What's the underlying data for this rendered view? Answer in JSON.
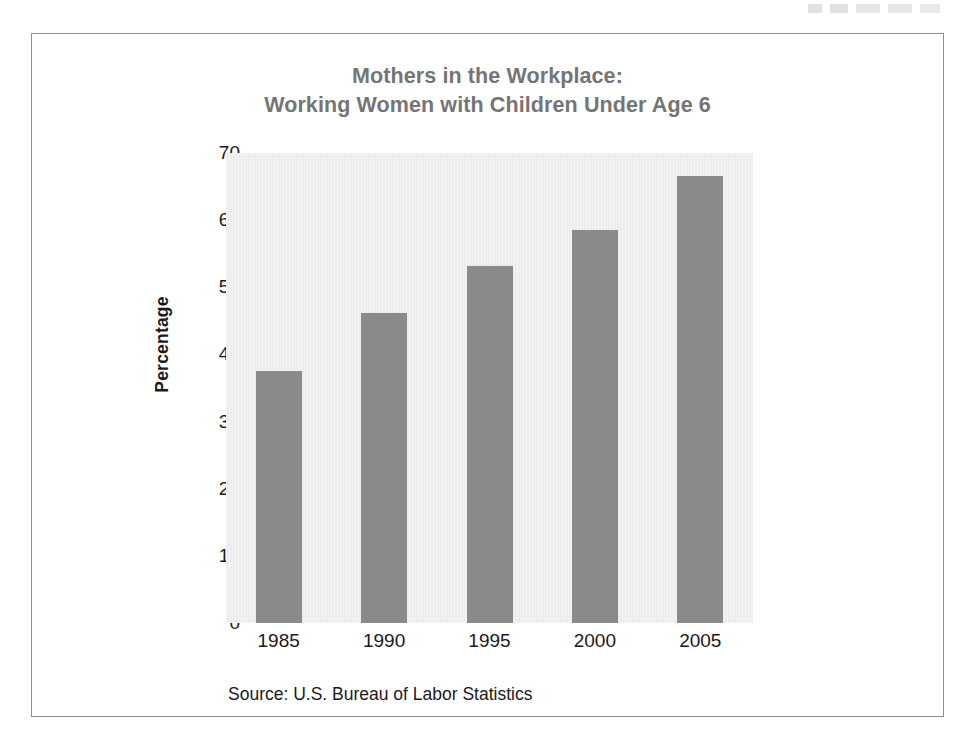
{
  "figure": {
    "title_line_1": "Mothers in the Workplace:",
    "title_line_2": "Working Women with Children Under Age 6",
    "source_note": "Source: U.S. Bureau of Labor Statistics",
    "title_color": "#757575",
    "frame_color": "#8e8e8e"
  },
  "chart_data": {
    "type": "bar",
    "title": "Mothers in the Workplace: Working Women with Children Under Age 6",
    "categories": [
      "1985",
      "1990",
      "1995",
      "2000",
      "2005"
    ],
    "values": [
      37.5,
      46.2,
      53.2,
      58.6,
      66.6
    ],
    "xlabel": "",
    "ylabel": "Percentage",
    "ylim": [
      0,
      70
    ],
    "yticks": [
      0,
      10,
      20,
      30,
      40,
      50,
      60,
      70
    ],
    "ytick_labels": [
      "0",
      "10",
      "20",
      "30",
      "40",
      "50",
      "60",
      "70"
    ],
    "grid": false,
    "legend": false,
    "bar_color": "#8a8a8a",
    "plot_background": "#ececec",
    "source": "Source: U.S. Bureau of Labor Statistics"
  }
}
